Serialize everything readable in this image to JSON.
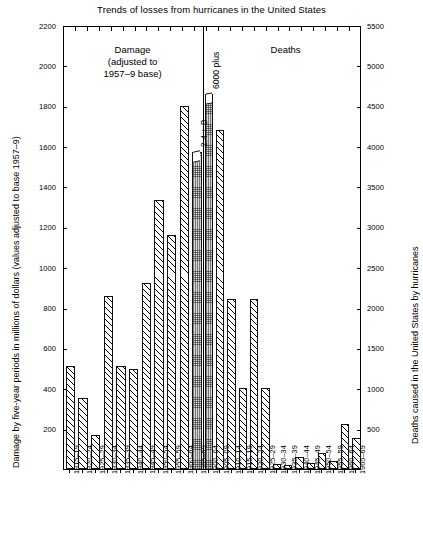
{
  "chart_data": {
    "type": "bar",
    "title": "Trends of losses from hurricanes in the United States",
    "panels": [
      {
        "name": "damage",
        "caption_lines": [
          "Damage",
          "(adjusted to",
          "1957–9 base)"
        ],
        "ylabel": "Damage by five-year periods in millions of dollars (values adjusted to base 1957–9)",
        "ylim": [
          0,
          2200
        ],
        "yticks": [
          0,
          200,
          400,
          600,
          800,
          1000,
          1200,
          1400,
          1600,
          1800,
          2000,
          2200
        ],
        "ytick_labels": [
          "0",
          "200",
          "400",
          "600",
          "800",
          "1000",
          "1200",
          "1400",
          "1600",
          "1800",
          "2000",
          "2200"
        ],
        "categories": [
          "1915–19",
          "1920–24",
          "1925–29",
          "1930–34",
          "1935–39",
          "1940–44",
          "1945–49",
          "1950–54",
          "1955–59",
          "1960–64",
          "1965–69"
        ],
        "values": [
          510,
          350,
          170,
          855,
          510,
          495,
          920,
          1335,
          1160,
          1800,
          2400
        ],
        "drawn_values": [
          510,
          350,
          170,
          855,
          510,
          495,
          920,
          1335,
          1160,
          1800,
          1570
        ],
        "broken_bars": [
          "1965–69"
        ],
        "annotations": [
          {
            "category": "1965–69",
            "text": "2.4 + B"
          }
        ]
      },
      {
        "name": "deaths",
        "caption_lines": [
          "Deaths"
        ],
        "ylabel": "Deaths caused in the United States by hurricanes",
        "ylim": [
          0,
          5500
        ],
        "yticks": [
          0,
          500,
          1000,
          1500,
          2000,
          2500,
          3000,
          3500,
          4000,
          4500,
          5000,
          5500
        ],
        "ytick_labels": [
          "0",
          "500",
          "1000",
          "1500",
          "2000",
          "2500",
          "3000",
          "3500",
          "4000",
          "4500",
          "5000",
          "5500"
        ],
        "categories": [
          "1900–04",
          "1905–09",
          "1910–14",
          "1915–19",
          "1920–24",
          "1925–29",
          "1930–34",
          "1935–39",
          "1940–44",
          "1945–49",
          "1950–54",
          "1955–59",
          "1960–64",
          "1965–69"
        ],
        "values": [
          6000,
          4200,
          2100,
          1000,
          2100,
          1000,
          60,
          50,
          150,
          80,
          200,
          100,
          560,
          390
        ],
        "drawn_values": [
          4650,
          4200,
          2100,
          1000,
          2100,
          1000,
          60,
          50,
          150,
          80,
          200,
          100,
          560,
          390
        ],
        "broken_bars": [
          "1900–04"
        ],
        "annotations": [
          {
            "category": "1900–04",
            "text": "6000 plus"
          }
        ]
      }
    ],
    "grid": false,
    "legend": "none"
  },
  "colors": {
    "axis": "#000000",
    "bar_hatch": "#ffffff",
    "bar_dotted": "#d8d8d8",
    "background": "#ffffff"
  }
}
